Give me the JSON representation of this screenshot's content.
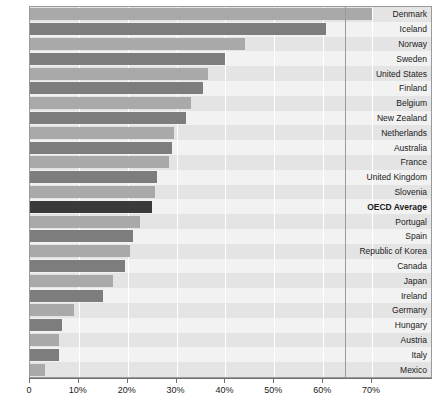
{
  "chart_data": {
    "type": "bar",
    "orientation": "horizontal",
    "title": "",
    "xlabel": "",
    "ylabel": "",
    "xlim": [
      0,
      70
    ],
    "xtick_labels": [
      "0",
      "10%",
      "20%",
      "30%",
      "40%",
      "50%",
      "60%",
      "70%"
    ],
    "xticks": [
      0,
      10,
      20,
      30,
      40,
      50,
      60,
      70
    ],
    "grid": true,
    "legend": "none",
    "categories": [
      "Denmark",
      "Iceland",
      "Norway",
      "Sweden",
      "United States",
      "Finland",
      "Belgium",
      "New Zealand",
      "Netherlands",
      "Australia",
      "France",
      "United Kingdom",
      "Slovenia",
      "OECD Average",
      "Portugal",
      "Spain",
      "Republic of Korea",
      "Canada",
      "Japan",
      "Ireland",
      "Germany",
      "Hungary",
      "Austria",
      "Italy",
      "Mexico"
    ],
    "values": [
      70.0,
      60.5,
      44.0,
      40.0,
      36.5,
      35.5,
      33.0,
      32.0,
      29.5,
      29.0,
      28.5,
      26.0,
      25.5,
      25.0,
      22.5,
      21.0,
      20.5,
      19.5,
      17.0,
      15.0,
      9.0,
      6.5,
      6.0,
      6.0,
      3.0
    ],
    "bar_colors": [
      "#a9a9a9",
      "#7d7d7d",
      "#a9a9a9",
      "#7d7d7d",
      "#a9a9a9",
      "#7d7d7d",
      "#a9a9a9",
      "#7d7d7d",
      "#a9a9a9",
      "#7d7d7d",
      "#a9a9a9",
      "#7d7d7d",
      "#a9a9a9",
      "#3a3a3a",
      "#a9a9a9",
      "#7d7d7d",
      "#a9a9a9",
      "#7d7d7d",
      "#a9a9a9",
      "#7d7d7d",
      "#a9a9a9",
      "#7d7d7d",
      "#a9a9a9",
      "#7d7d7d",
      "#a9a9a9"
    ],
    "highlight_category": "OECD Average"
  },
  "caption": {
    "text": ""
  },
  "colors": {
    "bar_light": "#a9a9a9",
    "bar_dark": "#7d7d7d",
    "bar_accent": "#3a3a3a",
    "band_a": "#e4e4e4",
    "band_b": "#f2f2f2",
    "frame": "#9a9a9a",
    "axis": "#6f6f6f",
    "text": "#1a1a1a"
  }
}
